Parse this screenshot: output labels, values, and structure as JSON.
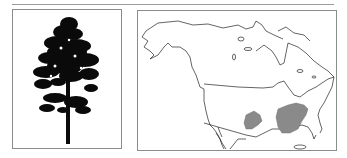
{
  "figure": {
    "tree_panel": {
      "icon": "tree-silhouette-icon",
      "description": "Black silhouette of a tall pine tree"
    },
    "map_panel": {
      "icon": "north-america-range-map",
      "region": "North America",
      "range_color": "#8a8a8a",
      "outline_color": "#222222",
      "range_areas": [
        "south-central-patch",
        "southeastern-united-states"
      ]
    }
  },
  "colors": {
    "border": "#8c8c8c",
    "rule": "#9a9a9a",
    "tree": "#0a0a0a",
    "background": "#ffffff"
  }
}
